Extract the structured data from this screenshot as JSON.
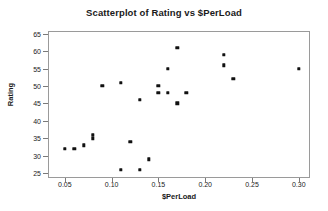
{
  "chart_data": {
    "type": "scatter",
    "title": "Scatterplot of Rating vs $PerLoad",
    "xlabel": "$PerLoad",
    "ylabel": "Rating",
    "xlim": [
      0.032,
      0.312
    ],
    "ylim": [
      23.6,
      65.8
    ],
    "xticks": [
      0.05,
      0.1,
      0.15,
      0.2,
      0.25,
      0.3
    ],
    "xtick_labels": [
      "0.05",
      "0.10",
      "0.15",
      "0.20",
      "0.25",
      "0.30"
    ],
    "yticks": [
      25,
      30,
      35,
      40,
      45,
      50,
      55,
      60,
      65
    ],
    "ytick_labels": [
      "25",
      "30",
      "35",
      "40",
      "45",
      "50",
      "55",
      "60",
      "65"
    ],
    "grid": false,
    "legend": null,
    "marker_color": "#111111",
    "frame_color": "#9a9a9a",
    "x": [
      0.05,
      0.06,
      0.07,
      0.08,
      0.08,
      0.09,
      0.11,
      0.11,
      0.12,
      0.13,
      0.13,
      0.14,
      0.15,
      0.15,
      0.16,
      0.16,
      0.17,
      0.17,
      0.18,
      0.22,
      0.22,
      0.23,
      0.3
    ],
    "y": [
      32,
      32,
      33,
      35,
      36,
      50,
      26,
      51,
      34,
      26,
      46,
      29,
      48,
      50,
      48,
      55,
      45,
      61,
      48,
      56,
      59,
      52,
      55
    ],
    "points": [
      {
        "x": 0.05,
        "y": 32
      },
      {
        "x": 0.06,
        "y": 32
      },
      {
        "x": 0.07,
        "y": 33
      },
      {
        "x": 0.08,
        "y": 35
      },
      {
        "x": 0.08,
        "y": 36
      },
      {
        "x": 0.09,
        "y": 50
      },
      {
        "x": 0.11,
        "y": 26
      },
      {
        "x": 0.11,
        "y": 51
      },
      {
        "x": 0.12,
        "y": 34
      },
      {
        "x": 0.13,
        "y": 26
      },
      {
        "x": 0.13,
        "y": 46
      },
      {
        "x": 0.14,
        "y": 29
      },
      {
        "x": 0.15,
        "y": 48
      },
      {
        "x": 0.15,
        "y": 50
      },
      {
        "x": 0.16,
        "y": 48
      },
      {
        "x": 0.16,
        "y": 55
      },
      {
        "x": 0.17,
        "y": 45
      },
      {
        "x": 0.17,
        "y": 61
      },
      {
        "x": 0.18,
        "y": 48
      },
      {
        "x": 0.22,
        "y": 56
      },
      {
        "x": 0.22,
        "y": 59
      },
      {
        "x": 0.23,
        "y": 52
      },
      {
        "x": 0.3,
        "y": 55
      }
    ]
  }
}
